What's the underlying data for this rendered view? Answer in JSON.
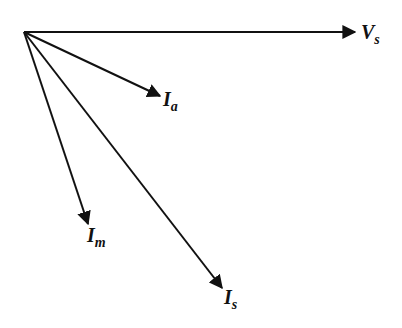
{
  "diagram": {
    "type": "phasor-diagram",
    "origin": {
      "x": 24,
      "y": 32
    },
    "color": "#111111",
    "phasors": [
      {
        "id": "Vs",
        "symbol": "V",
        "subscript": "s",
        "tip": {
          "x": 355,
          "y": 32
        },
        "label_pos": {
          "x": 361,
          "y": 39
        }
      },
      {
        "id": "Ia",
        "symbol": "I",
        "subscript": "a",
        "tip": {
          "x": 160,
          "y": 96
        },
        "label_pos": {
          "x": 163,
          "y": 106
        }
      },
      {
        "id": "Im",
        "symbol": "I",
        "subscript": "m",
        "tip": {
          "x": 88,
          "y": 224
        },
        "label_pos": {
          "x": 87,
          "y": 242
        }
      },
      {
        "id": "Is",
        "symbol": "I",
        "subscript": "s",
        "tip": {
          "x": 222,
          "y": 288
        },
        "label_pos": {
          "x": 224,
          "y": 304
        }
      }
    ]
  }
}
